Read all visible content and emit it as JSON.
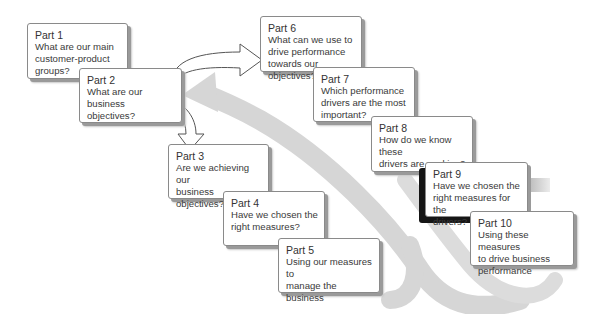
{
  "diagram": {
    "type": "process-flow",
    "colors": {
      "box_fill": "#ffffff",
      "box_border": "#8a8a8a",
      "shadow": "#9a9a9a",
      "swoosh": "#d4d4d4",
      "arrow_fill": "#ffffff",
      "arrow_stroke": "#555555"
    },
    "parts": [
      {
        "title": "Part 1",
        "question": [
          "What are our main",
          "customer-product",
          "groups?"
        ]
      },
      {
        "title": "Part 2",
        "question": [
          "What are our business",
          "objectives?"
        ]
      },
      {
        "title": "Part 3",
        "question": [
          "Are we achieving our",
          "business objectives?"
        ]
      },
      {
        "title": "Part 4",
        "question": [
          "Have we chosen the",
          "right measures?"
        ]
      },
      {
        "title": "Part 5",
        "question": [
          "Using our measures to",
          "manage the business"
        ]
      },
      {
        "title": "Part 6",
        "question": [
          "What can we use to",
          "drive performance",
          "towards our objectives?"
        ]
      },
      {
        "title": "Part 7",
        "question": [
          "Which performance",
          "drivers are the most",
          "important?"
        ]
      },
      {
        "title": "Part 8",
        "question": [
          "How do we know these",
          "drivers are working?"
        ]
      },
      {
        "title": "Part 9",
        "question": [
          "Have we chosen the",
          "right measures for the",
          "drivers?"
        ]
      },
      {
        "title": "Part 10",
        "question": [
          "Using these measures",
          "to drive business",
          "performance"
        ]
      }
    ],
    "connectors": [
      {
        "from": "Part 2",
        "to": "Part 6",
        "icon": "curved-arrow-right"
      },
      {
        "from": "Part 2",
        "to": "Part 3",
        "icon": "curved-arrow-down"
      },
      {
        "from": "Part 5",
        "to": "Part 2",
        "icon": "grey-feedback-swoosh"
      },
      {
        "from": "Part 10",
        "to": "Part 2",
        "icon": "grey-feedback-swoosh"
      }
    ]
  }
}
